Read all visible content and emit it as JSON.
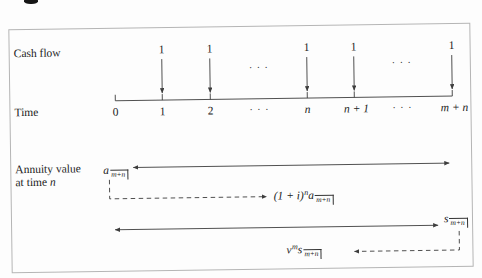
{
  "figure": {
    "rows": {
      "cash_flow": "Cash flow",
      "time": "Time",
      "annuity_value_line1": "Annuity value",
      "annuity_value_line2_text": "at time",
      "annuity_value_line2_var": "n"
    },
    "payments": [
      "1",
      "1",
      "1",
      "1",
      "1"
    ],
    "payment_dots": [
      "· · ·",
      "· · ·"
    ],
    "time_ticks": [
      "0",
      "1",
      "2",
      "· · ·",
      "n",
      "n + 1",
      "· · ·",
      "m + n"
    ],
    "formulas": {
      "pv": {
        "base": "a",
        "angle": "m+n"
      },
      "accumulated": {
        "prefix": "(1 + i)",
        "sup": "n",
        "base": "a",
        "angle": "m+n"
      },
      "fv": {
        "base": "s",
        "angle": "m+n"
      },
      "discounted": {
        "prefix": "v",
        "sup": "m",
        "base": "s",
        "angle": "m+n"
      }
    },
    "colors": {
      "ink": "#222222",
      "line": "#3d3d3d",
      "border": "#b5b5b5"
    }
  }
}
